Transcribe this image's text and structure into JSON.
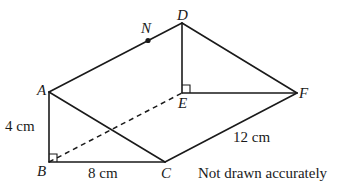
{
  "diagram": {
    "type": "triangular-prism",
    "vertices": {
      "A": {
        "label": "A",
        "x": 49,
        "y": 92
      },
      "B": {
        "label": "B",
        "x": 49,
        "y": 162
      },
      "C": {
        "label": "C",
        "x": 165,
        "y": 162
      },
      "D": {
        "label": "D",
        "x": 182,
        "y": 23
      },
      "E": {
        "label": "E",
        "x": 182,
        "y": 93
      },
      "F": {
        "label": "F",
        "x": 297,
        "y": 93
      },
      "N": {
        "label": "N",
        "x": 148,
        "y": 39
      }
    },
    "edges": [
      {
        "from": "A",
        "to": "B",
        "style": "solid"
      },
      {
        "from": "B",
        "to": "C",
        "style": "solid"
      },
      {
        "from": "A",
        "to": "C",
        "style": "solid"
      },
      {
        "from": "A",
        "to": "D",
        "style": "solid"
      },
      {
        "from": "D",
        "to": "E",
        "style": "solid"
      },
      {
        "from": "E",
        "to": "F",
        "style": "solid"
      },
      {
        "from": "D",
        "to": "F",
        "style": "solid"
      },
      {
        "from": "C",
        "to": "F",
        "style": "solid"
      },
      {
        "from": "B",
        "to": "E",
        "style": "dashed"
      }
    ],
    "right_angles": [
      "B",
      "E"
    ],
    "point_marker": "N",
    "measurements": {
      "ab": "4 cm",
      "bc": "8 cm",
      "cf": "12 cm"
    },
    "note": "Not drawn accurately"
  }
}
